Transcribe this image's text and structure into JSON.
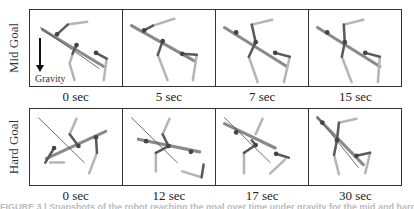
{
  "figure": {
    "rows": [
      {
        "label": "Mid Goal",
        "gravity_label": "Gravity",
        "panels": [
          {
            "time": "0 sec",
            "goal_line": [
              10,
              18,
              70,
              60
            ],
            "body": [
              12,
              20,
              75,
              58
            ],
            "joints": [
              [
                27,
                25
              ],
              [
                47,
                36
              ],
              [
                67,
                44
              ]
            ],
            "limbs_light": [
              [
                [
                  38,
                  15
                ],
                [
                  58,
                  12
                ]
              ],
              [
                [
                  43,
                  45
                ],
                [
                  40,
                  55
                ],
                [
                  45,
                  72
                ]
              ],
              [
                [
                  78,
                  50
                ],
                [
                  75,
                  72
                ]
              ]
            ],
            "limbs_dark": [
              [
                [
                  27,
                  25
                ],
                [
                  38,
                  15
                ]
              ],
              [
                [
                  47,
                  36
                ],
                [
                  43,
                  45
                ]
              ],
              [
                [
                  67,
                  44
                ],
                [
                  78,
                  50
                ]
              ]
            ]
          },
          {
            "time": "5 sec",
            "goal_line": null,
            "body": [
              8,
              16,
              72,
              52
            ],
            "joints": [
              [
                21,
                21
              ],
              [
                40,
                32
              ],
              [
                60,
                45
              ]
            ],
            "limbs_light": [
              [
                [
                  30,
                  16
                ],
                [
                  52,
                  9
                ]
              ],
              [
                [
                  35,
                  46
                ],
                [
                  45,
                  72
                ]
              ],
              [
                [
                  75,
                  46
                ],
                [
                  71,
                  72
                ]
              ]
            ],
            "limbs_dark": [
              [
                [
                  21,
                  21
                ],
                [
                  30,
                  16
                ]
              ],
              [
                [
                  40,
                  32
                ],
                [
                  35,
                  46
                ]
              ],
              [
                [
                  60,
                  45
                ],
                [
                  75,
                  46
                ]
              ]
            ]
          },
          {
            "time": "7 sec",
            "goal_line": null,
            "body": [
              8,
              18,
              72,
              58
            ],
            "joints": [
              [
                20,
                23
              ],
              [
                40,
                33
              ],
              [
                60,
                44
              ]
            ],
            "limbs_light": [
              [
                [
                  36,
                  15
                ],
                [
                  57,
                  10
                ]
              ],
              [
                [
                  33,
                  48
                ],
                [
                  42,
                  74
                ]
              ],
              [
                [
                  75,
                  48
                ],
                [
                  69,
                  74
                ]
              ]
            ],
            "limbs_dark": [
              [
                [
                  40,
                  33
                ],
                [
                  36,
                  15
                ]
              ],
              [
                [
                  40,
                  33
                ],
                [
                  33,
                  48
                ]
              ],
              [
                [
                  60,
                  44
                ],
                [
                  75,
                  48
                ]
              ]
            ]
          },
          {
            "time": "15 sec",
            "goal_line": null,
            "body": [
              8,
              18,
              72,
              58
            ],
            "joints": [
              [
                18,
                23
              ],
              [
                36,
                33
              ],
              [
                57,
                44
              ]
            ],
            "limbs_light": [
              [
                [
                  35,
                  15
                ],
                [
                  55,
                  10
                ]
              ],
              [
                [
                  33,
                  48
                ],
                [
                  43,
                  74
                ]
              ],
              [
                [
                  72,
                  48
                ],
                [
                  70,
                  74
                ]
              ]
            ],
            "limbs_dark": [
              [
                [
                  36,
                  33
                ],
                [
                  35,
                  15
                ]
              ],
              [
                [
                  36,
                  33
                ],
                [
                  33,
                  48
                ]
              ],
              [
                [
                  57,
                  44
                ],
                [
                  72,
                  48
                ]
              ]
            ]
          }
        ]
      },
      {
        "label": "Hard Goal",
        "gravity_label": "",
        "panels": [
          {
            "time": "0 sec",
            "goal_line": [
              8,
              9,
              55,
              55
            ],
            "body": [
              16,
              51,
              77,
              23
            ],
            "joints": [
              [
                24,
                40
              ],
              [
                49,
                38
              ],
              [
                67,
                29
              ]
            ],
            "limbs_light": [
              [
                [
                  40,
                  26
                ],
                [
                  47,
                  10
                ]
              ],
              [
                [
                  20,
                  55
                ],
                [
                  34,
                  55
                ]
              ],
              [
                [
                  68,
                  45
                ],
                [
                  60,
                  66
                ]
              ]
            ],
            "limbs_dark": [
              [
                [
                  49,
                  38
                ],
                [
                  40,
                  26
                ]
              ],
              [
                [
                  24,
                  40
                ],
                [
                  15,
                  55
                ]
              ],
              [
                [
                  67,
                  29
                ],
                [
                  68,
                  45
                ]
              ]
            ]
          },
          {
            "time": "12 sec",
            "goal_line": [
              8,
              9,
              55,
              55
            ],
            "body": [
              15,
              31,
              78,
              44
            ],
            "joints": [
              [
                23,
                33
              ],
              [
                46,
                38
              ],
              [
                69,
                44
              ]
            ],
            "limbs_light": [
              [
                [
                  40,
                  26
                ],
                [
                  47,
                  10
                ]
              ],
              [
                [
                  33,
                  45
                ],
                [
                  33,
                  64
                ]
              ],
              [
                [
                  60,
                  64
                ],
                [
                  80,
                  70
                ]
              ]
            ],
            "limbs_dark": [
              [
                [
                  46,
                  38
                ],
                [
                  40,
                  26
                ]
              ],
              [
                [
                  46,
                  38
                ],
                [
                  33,
                  45
                ]
              ],
              [
                [
                  80,
                  70
                ],
                [
                  82,
                  57
                ]
              ]
            ]
          },
          {
            "time": "17 sec",
            "goal_line": [
              8,
              9,
              55,
              55
            ],
            "body": [
              8,
              15,
              60,
              40
            ],
            "joints": [
              [
                20,
                24
              ],
              [
                40,
                37
              ],
              [
                61,
                46
              ]
            ],
            "limbs_light": [
              [
                [
                  40,
                  26
                ],
                [
                  47,
                  10
                ]
              ],
              [
                [
                  28,
                  45
                ],
                [
                  28,
                  66
                ]
              ],
              [
                [
                  70,
                  52
                ],
                [
                  55,
                  66
                ]
              ]
            ],
            "limbs_dark": [
              [
                [
                  40,
                  37
                ],
                [
                  36,
                  32
                ]
              ],
              [
                [
                  40,
                  37
                ],
                [
                  28,
                  45
                ]
              ],
              [
                [
                  61,
                  46
                ],
                [
                  74,
                  50
                ]
              ]
            ]
          },
          {
            "time": "30 sec",
            "goal_line": [
              8,
              8,
              50,
              60
            ],
            "body": [
              8,
              9,
              55,
              57
            ],
            "joints": [
              [
                13,
                14
              ],
              [
                28,
                32
              ],
              [
                48,
                48
              ]
            ],
            "limbs_light": [
              [
                [
                  30,
                  14
                ],
                [
                  48,
                  10
                ]
              ],
              [
                [
                  25,
                  47
                ],
                [
                  30,
                  67
                ]
              ],
              [
                [
                  62,
                  45
                ],
                [
                  57,
                  66
                ]
              ]
            ],
            "limbs_dark": [
              [
                [
                  28,
                  32
                ],
                [
                  30,
                  14
                ]
              ],
              [
                [
                  28,
                  32
                ],
                [
                  25,
                  47
                ]
              ],
              [
                [
                  48,
                  48
                ],
                [
                  62,
                  45
                ]
              ]
            ]
          }
        ]
      }
    ],
    "caption": "FIGURE 3 | Snapshots of the robot reaching the goal over time under gravity for the mid and hard goals."
  },
  "colors": {
    "frame": "#333333",
    "goal_line": "#444444",
    "body": "#8a8a8a",
    "limb_light": "#b5b5b5",
    "limb_dark": "#5a5a5a",
    "joint": "#444444"
  }
}
